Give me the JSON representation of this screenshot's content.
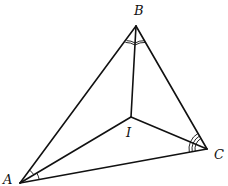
{
  "diagram": {
    "type": "geometry",
    "points": {
      "A": {
        "label": "A",
        "x": 20,
        "y": 183,
        "label_x": 3,
        "label_y": 184
      },
      "B": {
        "label": "B",
        "x": 136,
        "y": 26,
        "label_x": 134,
        "label_y": 15
      },
      "C": {
        "label": "C",
        "x": 207,
        "y": 149,
        "label_x": 214,
        "label_y": 159
      },
      "I": {
        "label": "I",
        "x": 131,
        "y": 117,
        "label_x": 126,
        "label_y": 137
      }
    },
    "segments": [
      {
        "from": "A",
        "to": "B"
      },
      {
        "from": "B",
        "to": "C"
      },
      {
        "from": "C",
        "to": "A"
      },
      {
        "from": "A",
        "to": "I"
      },
      {
        "from": "B",
        "to": "I"
      },
      {
        "from": "C",
        "to": "I"
      }
    ],
    "angle_marks": [
      {
        "vertex": "A",
        "arcs": 1,
        "between": [
          "B",
          "I"
        ]
      },
      {
        "vertex": "A",
        "arcs": 1,
        "between": [
          "I",
          "C"
        ]
      },
      {
        "vertex": "B",
        "arcs": 2,
        "between": [
          "A",
          "I"
        ]
      },
      {
        "vertex": "B",
        "arcs": 2,
        "between": [
          "I",
          "C"
        ]
      },
      {
        "vertex": "C",
        "arcs": 3,
        "between": [
          "B",
          "I"
        ]
      },
      {
        "vertex": "C",
        "arcs": 3,
        "between": [
          "I",
          "A"
        ]
      }
    ],
    "colors": {
      "stroke": "#111111",
      "background": "#ffffff"
    }
  }
}
